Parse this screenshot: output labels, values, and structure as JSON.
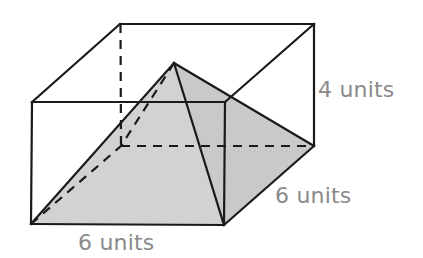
{
  "figure": {
    "background_color": "#ffffff",
    "line_color": "#1a1a1a",
    "hidden_line_color": "#1a1a1a",
    "label_color": "#8a8a8a",
    "face_fill_light": "#d9d9d9",
    "face_fill_mid": "#cfcfcf",
    "face_fill_dark": "#c2c2c2",
    "face_fill_right": "#cacaca"
  },
  "labels": {
    "height": "4 units",
    "depth": "6 units",
    "width": "6 units"
  },
  "geometry": {
    "prism": {
      "front_top_left": [
        32,
        102
      ],
      "front_top_right": [
        225,
        102
      ],
      "front_bottom_left": [
        31,
        224
      ],
      "front_bottom_right": [
        224,
        225
      ],
      "back_top_left": [
        120,
        24
      ],
      "back_top_right": [
        314,
        24
      ],
      "back_bottom_left": [
        121,
        146
      ],
      "back_bottom_right": [
        314,
        146
      ]
    },
    "pyramid": {
      "apex": [
        174,
        63
      ],
      "base_front_left": [
        31,
        224
      ],
      "base_front_right": [
        224,
        225
      ],
      "base_back_right": [
        314,
        146
      ],
      "base_back_left": [
        121,
        146
      ]
    }
  }
}
